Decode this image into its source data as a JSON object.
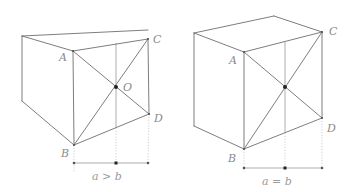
{
  "figures": [
    {
      "id": "left",
      "labels": {
        "A": "A",
        "B": "B",
        "C": "C",
        "D": "D",
        "O": "O"
      },
      "caption": "a > b",
      "points": {
        "back_top_left": [
          22,
          36
        ],
        "back_top_right": [
          95,
          30
        ],
        "C": [
          148,
          39
        ],
        "A": [
          73,
          51
        ],
        "O": [
          116,
          87
        ],
        "D": [
          149,
          114
        ],
        "B": [
          74,
          145
        ],
        "back_bottom_left": [
          22,
          101
        ],
        "mid_top": [
          116,
          43
        ],
        "mid_bottom": [
          116,
          128
        ]
      },
      "dimension": {
        "y": 163,
        "x": [
          74,
          116,
          148
        ]
      }
    },
    {
      "id": "right",
      "labels": {
        "A": "A",
        "B": "B",
        "C": "C",
        "D": "D"
      },
      "caption": "a = b",
      "points": {
        "back_top_left": [
          194,
          33
        ],
        "back_top_right": [
          274,
          16
        ],
        "C": [
          322,
          32
        ],
        "A": [
          244,
          52
        ],
        "O": [
          285,
          87
        ],
        "D": [
          322,
          118
        ],
        "B": [
          244,
          149
        ],
        "back_bottom_left": [
          194,
          126
        ],
        "mid_top": [
          285,
          41
        ],
        "mid_bottom": [
          285,
          133
        ]
      },
      "dimension": {
        "y": 168,
        "x": [
          244,
          285,
          322
        ]
      }
    }
  ]
}
